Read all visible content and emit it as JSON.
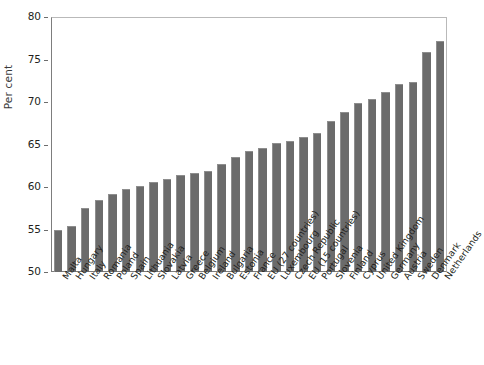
{
  "chart_data": {
    "type": "bar",
    "title": "",
    "subtitle": "",
    "xlabel": "",
    "ylabel": "Per cent",
    "ylim": [
      50,
      80
    ],
    "yticks": [
      50,
      55,
      60,
      65,
      70,
      75,
      80
    ],
    "ytick_labels": [
      "50",
      "55",
      "60",
      "65",
      "70",
      "75",
      "80"
    ],
    "grid": false,
    "legend": "none",
    "bar_color": "#6b6b6b",
    "orientation": "vertical",
    "categories": [
      "Malta",
      "Hungary",
      "Italy",
      "Romania",
      "Poland",
      "Spain",
      "Lithuania",
      "Slovakia",
      "Latvia",
      "Greece",
      "Belgium",
      "Ireland",
      "Bulgaria",
      "Estonia",
      "France",
      "EU (27 countries)",
      "Luxembourg",
      "Czech Republic",
      "EU (15 countries)",
      "Portugal",
      "Slovenia",
      "Finland",
      "Cyprus",
      "United Kingdom",
      "Germany",
      "Austria",
      "Sweden",
      "Denmark",
      "Netherlands"
    ],
    "values": [
      55.0,
      55.4,
      57.5,
      58.5,
      59.2,
      59.8,
      60.1,
      60.6,
      61.0,
      61.4,
      61.6,
      61.9,
      62.7,
      63.5,
      64.2,
      64.6,
      65.2,
      65.4,
      65.9,
      66.4,
      67.8,
      68.8,
      69.9,
      70.3,
      71.2,
      72.1,
      72.4,
      75.9,
      77.2
    ]
  }
}
